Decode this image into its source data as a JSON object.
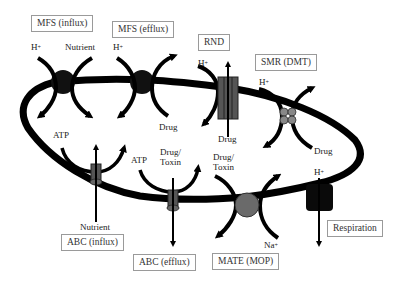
{
  "diagram": {
    "type": "bacterial cell membrane transporters",
    "transporters": [
      {
        "id": "mfs-influx",
        "label": "MFS (influx)",
        "substrates": [
          "H+",
          "Nutrient"
        ],
        "shape": "circle",
        "color": "#111111"
      },
      {
        "id": "mfs-efflux",
        "label": "MFS (efflux)",
        "substrates": [
          "H+",
          "Drug"
        ],
        "shape": "circle",
        "color": "#111111"
      },
      {
        "id": "rnd",
        "label": "RND",
        "substrates": [
          "H+",
          "Drug"
        ],
        "shape": "tripartite-rect",
        "color": "#555555"
      },
      {
        "id": "smr",
        "label": "SMR (DMT)",
        "substrates": [
          "H+",
          "Drug"
        ],
        "shape": "four-subunit",
        "color": "#777777"
      },
      {
        "id": "abc-influx",
        "label": "ABC (influx)",
        "substrates": [
          "ATP",
          "Nutrient"
        ],
        "shape": "narrow-rect",
        "color": "#444444"
      },
      {
        "id": "abc-efflux",
        "label": "ABC (efflux)",
        "substrates": [
          "ATP",
          "Drug/ Toxin"
        ],
        "shape": "narrow-rect",
        "color": "#444444"
      },
      {
        "id": "mate",
        "label": "MATE (MOP)",
        "substrates": [
          "Drug/ Toxin",
          "Na+"
        ],
        "shape": "circle",
        "color": "#6a6a6a"
      },
      {
        "id": "respiration",
        "label": "Respiration",
        "substrates": [
          "H+"
        ],
        "shape": "rounded-square",
        "color": "#0a0a0a"
      }
    ],
    "text": {
      "h_plus": "H",
      "plus": "+",
      "na": "Na",
      "nutrient": "Nutrient",
      "drug": "Drug",
      "atp": "ATP",
      "drug_toxin_1": "Drug/",
      "drug_toxin_2": "Toxin"
    }
  }
}
